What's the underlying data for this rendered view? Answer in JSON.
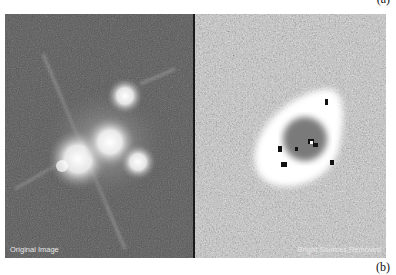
{
  "figure": {
    "labels": {
      "a": "(a)",
      "b": "(b)"
    },
    "panels": [
      {
        "id": "left",
        "caption": "Original Image",
        "description": "Bright point sources with diffraction spikes on dark noisy background"
      },
      {
        "id": "right",
        "caption": "Bright Sources Removed",
        "description": "Residual image showing bright ring-shaped arc after point source subtraction"
      }
    ],
    "colors": {
      "left_bg": "#555555",
      "right_bg": "#8a8a8a",
      "divider": "#1a1a1a",
      "caption": "#e8e8e8"
    }
  }
}
